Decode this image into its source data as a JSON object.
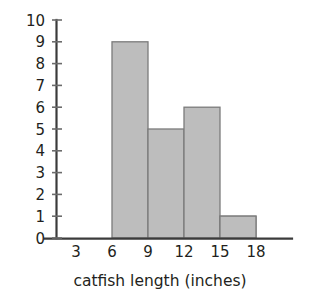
{
  "chart_data": {
    "type": "bar",
    "title": "",
    "xlabel": "catfish length (inches)",
    "ylabel": "",
    "categories": [
      "3-6",
      "6-9",
      "9-12",
      "12-15",
      "15-18"
    ],
    "bin_edges": [
      3,
      6,
      9,
      12,
      15,
      18
    ],
    "values": [
      4,
      9,
      5,
      6,
      1
    ],
    "xlim": [
      0,
      21
    ],
    "ylim": [
      0,
      10
    ],
    "x_tick_labels": [
      "3",
      "6",
      "9",
      "12",
      "15",
      "18"
    ],
    "x_tick_values": [
      3,
      6,
      9,
      12,
      15,
      18
    ],
    "y_tick_labels": [
      "0",
      "1",
      "2",
      "3",
      "4",
      "5",
      "6",
      "7",
      "8",
      "9",
      "10"
    ],
    "y_tick_values": [
      0,
      1,
      2,
      3,
      4,
      5,
      6,
      7,
      8,
      9,
      10
    ],
    "grid": false,
    "legend": null,
    "bar_fill_color": "#bdbdbd",
    "bar_border_color": "#7b7b7b",
    "axis_color": "#3b3b3b",
    "text_color": "#231f20",
    "background_color": "#ffffff"
  }
}
